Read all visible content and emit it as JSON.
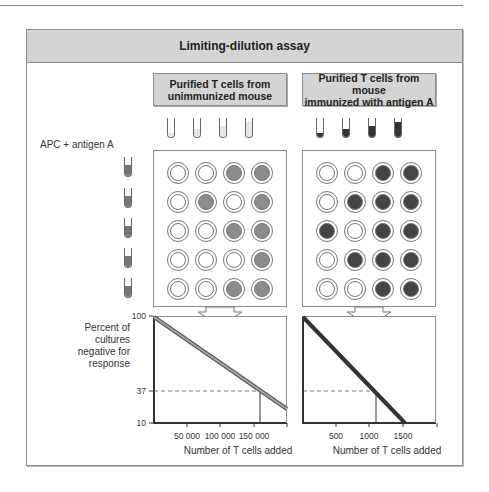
{
  "title": "Limiting-dilution assay",
  "groups": [
    {
      "label_line1": "Purified T cells from",
      "label_line2": "unimmunized mouse",
      "tube_color": "#e6e6e6",
      "tube_fill_levels": [
        0.2,
        0.4,
        0.6,
        0.8
      ],
      "positive_color": "#8c8c8c",
      "wells": [
        [
          0,
          0,
          1,
          1
        ],
        [
          0,
          1,
          0,
          1
        ],
        [
          0,
          0,
          1,
          1
        ],
        [
          0,
          0,
          0,
          1
        ],
        [
          0,
          0,
          1,
          1
        ]
      ]
    },
    {
      "label_line1": "Purified T cells from mouse",
      "label_line2": "immunized with antigen A",
      "tube_color": "#333333",
      "tube_fill_levels": [
        0.2,
        0.4,
        0.6,
        0.8
      ],
      "positive_color": "#444444",
      "wells": [
        [
          0,
          0,
          1,
          1
        ],
        [
          0,
          1,
          1,
          1
        ],
        [
          1,
          0,
          1,
          1
        ],
        [
          0,
          1,
          1,
          1
        ],
        [
          0,
          0,
          1,
          1
        ]
      ]
    }
  ],
  "apc_label": "APC + antigen A",
  "apc_tube_color": "#777777",
  "ylabel_lines": [
    "Percent of",
    "cultures",
    "negative for",
    "response"
  ],
  "xlabel": "Number of T cells added",
  "chart_data": [
    {
      "type": "line",
      "title": "Purified T cells from unimmunized mouse",
      "xlabel": "Number of T cells added",
      "ylabel": "Percent of cultures negative for response",
      "yscale": "log",
      "yticks": [
        "100",
        "37",
        "10"
      ],
      "xticks": [
        "50 000",
        "100 000",
        "150 000"
      ],
      "xlim": [
        0,
        200000
      ],
      "ylim": [
        10,
        100
      ],
      "series": [
        {
          "name": "unimmunized",
          "x": [
            0,
            160000,
            200000
          ],
          "y": [
            100,
            37,
            22
          ]
        }
      ],
      "annotation": {
        "y": 37,
        "x_at_37": 160000
      },
      "line_color": "#999999"
    },
    {
      "type": "line",
      "title": "Purified T cells from mouse immunized with antigen A",
      "xlabel": "Number of T cells added",
      "ylabel": "Percent of cultures negative for response",
      "yscale": "log",
      "yticks": [
        "100",
        "37",
        "10"
      ],
      "xticks": [
        "500",
        "1000",
        "1500"
      ],
      "xlim": [
        0,
        2000
      ],
      "ylim": [
        10,
        100
      ],
      "series": [
        {
          "name": "immunized",
          "x": [
            0,
            1100,
            1530
          ],
          "y": [
            100,
            37,
            10
          ]
        }
      ],
      "annotation": {
        "y": 37,
        "x_at_37": 1100
      },
      "line_color": "#444444"
    }
  ]
}
